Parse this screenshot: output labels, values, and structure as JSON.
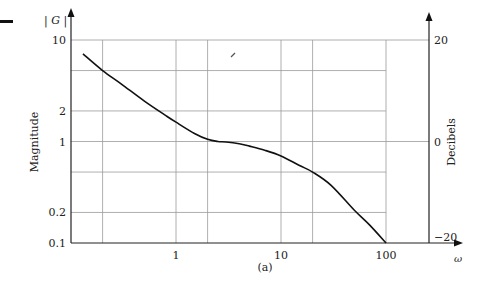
{
  "chart_data": {
    "type": "line",
    "title": "",
    "caption": "(a)",
    "xlabel": "ω",
    "ylabel": "Magnitude",
    "ylabel_top": "| G |",
    "y2label": "Decibels",
    "xscale": "log",
    "yscale": "log",
    "xlim": [
      0.1,
      300
    ],
    "ylim": [
      0.1,
      10
    ],
    "y2lim": [
      -20,
      20
    ],
    "grid": true,
    "legend": null,
    "x_ticks": [
      {
        "value": 1,
        "label": "1"
      },
      {
        "value": 10,
        "label": "10"
      },
      {
        "value": 100,
        "label": "100"
      }
    ],
    "y_ticks": [
      {
        "value": 10,
        "label": "10"
      },
      {
        "value": 2,
        "label": "2"
      },
      {
        "value": 1,
        "label": "1"
      },
      {
        "value": 0.2,
        "label": "0.2"
      },
      {
        "value": 0.1,
        "label": "0.1"
      }
    ],
    "y2_ticks": [
      {
        "value": 20,
        "label": "20"
      },
      {
        "value": 0,
        "label": "0"
      },
      {
        "value": -20,
        "label": "−20"
      }
    ],
    "series": [
      {
        "name": "|G|",
        "x": [
          0.13,
          0.2,
          0.3,
          0.5,
          0.8,
          1.0,
          1.5,
          2.0,
          2.5,
          3.0,
          4.0,
          5.0,
          7.0,
          10,
          15,
          20,
          30,
          50,
          70,
          100
        ],
        "y": [
          7.3,
          5.0,
          3.7,
          2.5,
          1.8,
          1.55,
          1.2,
          1.05,
          1.0,
          0.99,
          0.95,
          0.9,
          0.82,
          0.72,
          0.58,
          0.5,
          0.37,
          0.21,
          0.15,
          0.1
        ]
      }
    ]
  }
}
